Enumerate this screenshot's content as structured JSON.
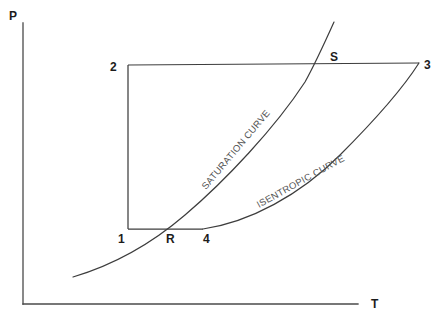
{
  "figure": {
    "kind": "thermodynamic-cycle-diagram",
    "background_color": "#ffffff",
    "line_color": "#3d3d3d",
    "text_color": "#1c1c1c",
    "curve_label_color": "#555555"
  },
  "axes": {
    "y_label": "P",
    "x_label": "T",
    "y_label_pos": {
      "x": 9,
      "y": 20
    },
    "x_label_pos": {
      "x": 371,
      "y": 308
    },
    "origin": {
      "x": 23,
      "y": 304
    },
    "y_axis_top": {
      "x": 23,
      "y": 23
    },
    "x_axis_right": {
      "x": 358,
      "y": 304
    }
  },
  "state_points": [
    {
      "id": "1",
      "label": "1",
      "x": 128,
      "y": 229,
      "label_x": 118,
      "label_y": 243
    },
    {
      "id": "2",
      "label": "2",
      "x": 128,
      "y": 65,
      "label_x": 110,
      "label_y": 71
    },
    {
      "id": "3",
      "label": "3",
      "x": 419,
      "y": 63,
      "label_x": 424,
      "label_y": 69
    },
    {
      "id": "4",
      "label": "4",
      "x": 203,
      "y": 229,
      "label_x": 203,
      "label_y": 243
    },
    {
      "id": "R",
      "label": "R",
      "x": 172,
      "y": 229,
      "label_x": 166,
      "label_y": 243
    },
    {
      "id": "S",
      "label": "S",
      "x": 323,
      "y": 64,
      "label_x": 330,
      "label_y": 61
    }
  ],
  "cycle_paths": [
    {
      "name": "process-1-to-2",
      "from": "1",
      "to": "2",
      "d": "M 128 229 L 128 65"
    },
    {
      "name": "process-2-to-3",
      "from": "2",
      "to": "3",
      "d": "M 128 65 L 419 63"
    },
    {
      "name": "process-1-to-4",
      "from": "1",
      "to": "4",
      "d": "M 128 229 L 203 229"
    }
  ],
  "curves": [
    {
      "name": "saturation-curve",
      "label": "SATURATION CURVE",
      "d": "M 73 277 C 110 266, 150 245, 185 215 C 225 181, 275 128, 305 82 C 315 64, 325 42, 334 22",
      "label_pos": {
        "x": 206,
        "y": 190
      },
      "label_rotation": -50
    },
    {
      "name": "isentropic-curve",
      "label": "ISENTROPIC CURVE",
      "d": "M 203 229 C 250 222, 300 195, 340 155 C 375 120, 405 85, 419 63",
      "label_pos": {
        "x": 259,
        "y": 208
      },
      "label_rotation": -29
    }
  ]
}
